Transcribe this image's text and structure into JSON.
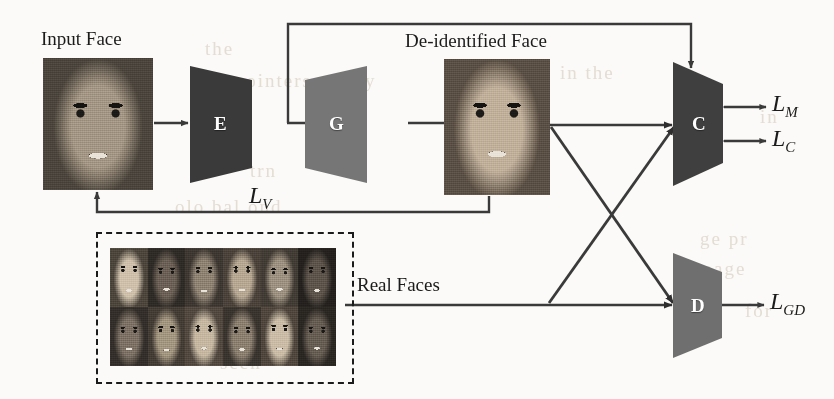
{
  "figure": {
    "type": "architecture-diagram"
  },
  "labels": {
    "input_face": "Input Face",
    "deid_face": "De-identified Face",
    "real_faces": "Real Faces"
  },
  "blocks": [
    {
      "id": "E",
      "letter": "E",
      "name": "encoder",
      "fill": "#3a3a3a"
    },
    {
      "id": "G",
      "letter": "G",
      "name": "generator",
      "fill": "#767676"
    },
    {
      "id": "C",
      "letter": "C",
      "name": "classifier",
      "fill": "#3f3f3f"
    },
    {
      "id": "D",
      "letter": "D",
      "name": "discriminator",
      "fill": "#6f6f6f"
    }
  ],
  "losses": [
    {
      "id": "LV",
      "symbol": "L",
      "sub": "V",
      "full": "L_V"
    },
    {
      "id": "LM",
      "symbol": "L",
      "sub": "M",
      "full": "L_M"
    },
    {
      "id": "LC",
      "symbol": "L",
      "sub": "C",
      "full": "L_C"
    },
    {
      "id": "LGD",
      "symbol": "L",
      "sub": "GD",
      "full": "L_GD"
    }
  ],
  "colors": {
    "line": "#3a3a3a",
    "paper": "#fbfaf8",
    "ink": "#1b1b1b"
  },
  "real_faces_grid": {
    "columns": 6,
    "rows": 2,
    "count": 12
  },
  "ghost_text": [
    {
      "t": "the",
      "x": 205,
      "y": 38
    },
    {
      "t": "on pointers, delay",
      "x": 205,
      "y": 70
    },
    {
      "t": "in the",
      "x": 560,
      "y": 62
    },
    {
      "t": "ge pr",
      "x": 700,
      "y": 228
    },
    {
      "t": "aned",
      "x": 205,
      "y": 128
    },
    {
      "t": "trn",
      "x": 250,
      "y": 160
    },
    {
      "t": "olo bal ond",
      "x": 175,
      "y": 196
    },
    {
      "t": "image",
      "x": 690,
      "y": 258
    },
    {
      "t": "in",
      "x": 760,
      "y": 106
    },
    {
      "t": "for",
      "x": 745,
      "y": 300
    },
    {
      "t": "seen",
      "x": 220,
      "y": 352
    }
  ]
}
